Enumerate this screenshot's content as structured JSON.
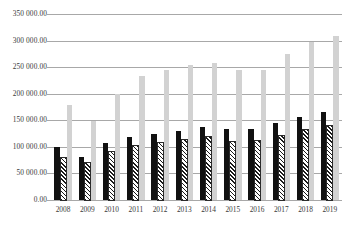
{
  "chart_data": {
    "type": "bar",
    "title": "",
    "subtitle": "",
    "xlabel": "",
    "ylabel": "",
    "categories": [
      "2008",
      "2009",
      "2010",
      "2011",
      "2012",
      "2013",
      "2014",
      "2015",
      "2016",
      "2017",
      "2018",
      "2019"
    ],
    "series": [
      {
        "name": "series-1-black",
        "color": "#111111",
        "pattern": "solid",
        "values": [
          100000,
          81000,
          107000,
          119000,
          124000,
          130000,
          138000,
          133000,
          134000,
          144000,
          157000,
          165000
        ]
      },
      {
        "name": "series-2-hatched",
        "color": "#1a1a1a",
        "pattern": "diagonal-stripe",
        "values": [
          79000,
          69000,
          90000,
          101000,
          107000,
          112000,
          118000,
          109000,
          111000,
          120000,
          131000,
          139000
        ]
      },
      {
        "name": "series-3-lightgray",
        "color": "#d2d2d2",
        "pattern": "solid",
        "values": [
          178000,
          148000,
          199000,
          233000,
          244000,
          254000,
          258000,
          245000,
          244000,
          274000,
          297000,
          309000
        ]
      }
    ],
    "ylim": [
      0,
      350000
    ],
    "y_ticks": [
      0,
      50000,
      100000,
      150000,
      200000,
      250000,
      300000,
      350000
    ],
    "y_tick_labels": [
      "0.00",
      "50 000.00",
      "100 000.00",
      "150 000.00",
      "200 000.00",
      "250 000.00",
      "300 000.00",
      "350 000.00"
    ],
    "grid": true,
    "grid_axis": "y",
    "legend": false,
    "legend_position": "none",
    "gridline_color": "#a8a8a8",
    "background_color": "#ffffff",
    "text_color": "#3a3a3a"
  }
}
